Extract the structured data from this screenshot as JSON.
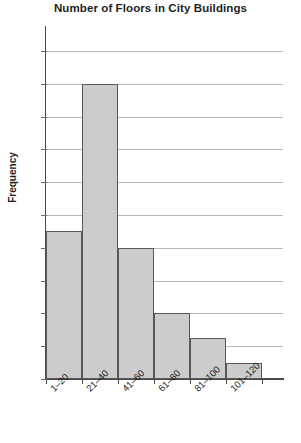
{
  "chart_data": {
    "type": "bar",
    "title": "Number of Floors in City Buildings",
    "xlabel": "",
    "ylabel": "Frequency",
    "categories": [
      "1–20",
      "21–40",
      "41–60",
      "61–80",
      "81–100",
      "101–120"
    ],
    "values": [
      18,
      36,
      16,
      8,
      5,
      2
    ],
    "ylim": [
      0,
      40
    ],
    "ytick_labels": [
      "0",
      "4",
      "8",
      "12",
      "16",
      "20",
      "24",
      "28",
      "32",
      "36",
      "40"
    ],
    "ytick_values": [
      0,
      4,
      8,
      12,
      16,
      20,
      24,
      28,
      32,
      36,
      40
    ],
    "grid": "horizontal",
    "legend": "none",
    "bar_fill_color": "#cccccc",
    "bar_edge_color": "#585858",
    "gridline_color": "#b8b8b8",
    "axis_color": "#4a4a4a",
    "text_color": "#231f20"
  }
}
